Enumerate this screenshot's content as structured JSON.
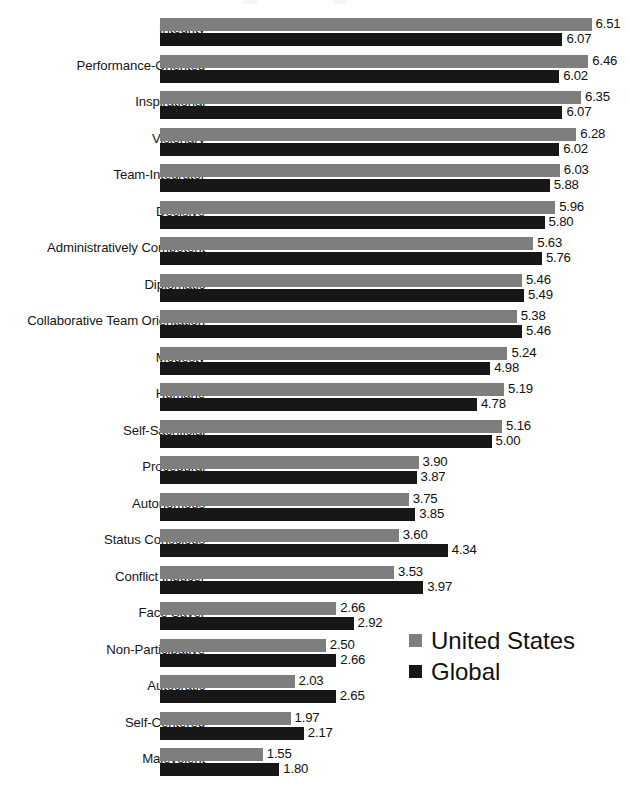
{
  "chart_data": {
    "type": "bar",
    "orientation": "horizontal",
    "title": "",
    "subtitle": "",
    "xlabel": "",
    "ylabel": "",
    "xlim": [
      0,
      7
    ],
    "grid": false,
    "legend_position": "center-right",
    "value_format": "0.00",
    "categories": [
      "Integrity",
      "Performance-Oriented",
      "Inspirational",
      "Visionary",
      "Team-Integrator",
      "Decisive",
      "Administratively Competent",
      "Diplomatic",
      "Collaborative Team Orientation",
      "Modesty",
      "Humane",
      "Self-Sacrificial",
      "Procedural",
      "Autonomous",
      "Status Conscious",
      "Conflict Inducer",
      "Face Saver",
      "Non-Participative",
      "Autocratic",
      "Self-Centered",
      "Malevolent"
    ],
    "series": [
      {
        "name": "United States",
        "color": "#7e7e7e",
        "values": [
          6.51,
          6.46,
          6.35,
          6.28,
          6.03,
          5.96,
          5.63,
          5.46,
          5.38,
          5.24,
          5.19,
          5.16,
          3.9,
          3.75,
          3.6,
          3.53,
          2.66,
          2.5,
          2.03,
          1.97,
          1.55
        ],
        "labels": [
          "6.51",
          "6.46",
          "6.35",
          "6.28",
          "6.03",
          "5.96",
          "5.63",
          "5.46",
          "5.38",
          "5.24",
          "5.19",
          "5.16",
          "3.90",
          "3.75",
          "3.60",
          "3.53",
          "2.66",
          "2.50",
          "2.03",
          "1.97",
          "1.55"
        ]
      },
      {
        "name": "Global",
        "color": "#171717",
        "values": [
          6.07,
          6.02,
          6.07,
          6.02,
          5.88,
          5.8,
          5.76,
          5.49,
          5.46,
          4.98,
          4.78,
          5.0,
          3.87,
          3.85,
          4.34,
          3.97,
          2.92,
          2.66,
          2.65,
          2.17,
          1.8
        ],
        "labels": [
          "6.07",
          "6.02",
          "6.07",
          "6.02",
          "5.88",
          "5.80",
          "5.76",
          "5.49",
          "5.46",
          "4.98",
          "4.78",
          "5.00",
          "3.87",
          "3.85",
          "4.34",
          "3.97",
          "2.92",
          "2.66",
          "2.65",
          "2.17",
          "1.80"
        ]
      }
    ]
  },
  "legend": {
    "items": [
      {
        "label": "United States",
        "color": "#7e7e7e"
      },
      {
        "label": "Global",
        "color": "#171717"
      }
    ]
  }
}
